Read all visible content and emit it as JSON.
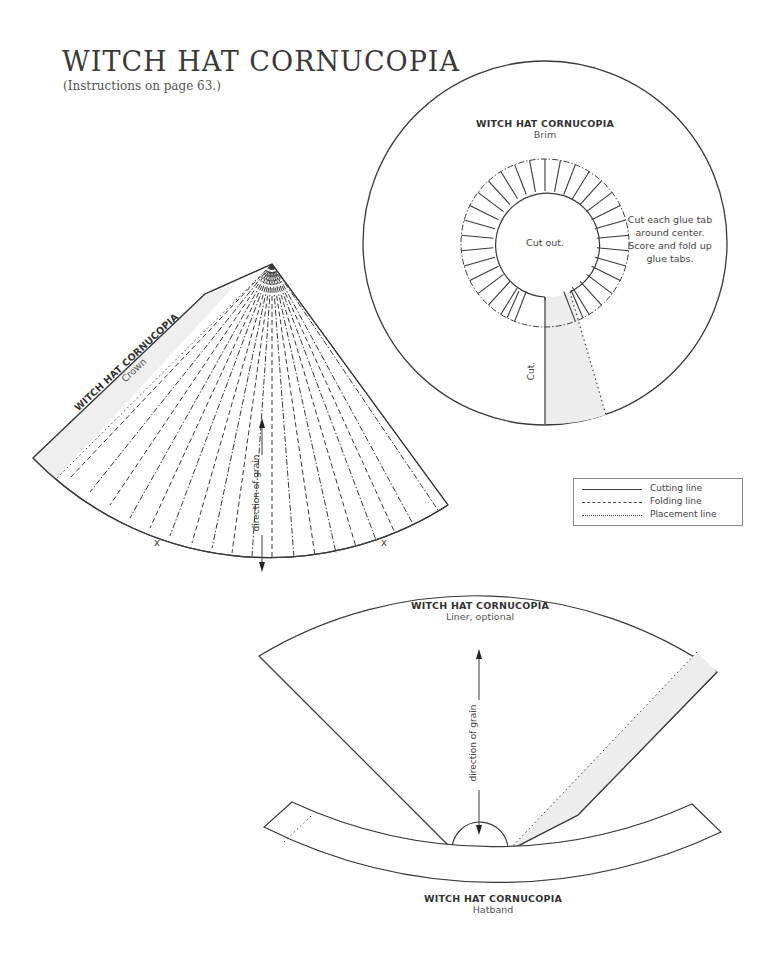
{
  "header": {
    "title": "WITCH HAT CORNUCOPIA",
    "subtitle": "(Instructions on page 63.)"
  },
  "pieces": {
    "brim": {
      "title": "WITCH HAT CORNUCOPIA",
      "name": "Brim",
      "center_label": "Cut out.",
      "cut_label": "Cut.",
      "note": [
        "Cut each glue tab",
        "around center.",
        "Score and fold up",
        "glue tabs."
      ]
    },
    "crown": {
      "title": "WITCH HAT CORNUCOPIA",
      "name": "Crown",
      "grain_label": "direction of grain",
      "marks": [
        "x",
        "x"
      ]
    },
    "liner": {
      "title": "WITCH HAT CORNUCOPIA",
      "name": "Liner, optional",
      "grain_label": "direction of grain"
    },
    "hatband": {
      "title": "WITCH HAT CORNUCOPIA",
      "name": "Hatband"
    }
  },
  "legend": {
    "items": [
      {
        "label": "Cutting line",
        "style": "solid"
      },
      {
        "label": "Folding line",
        "style": "dash-dot"
      },
      {
        "label": "Placement line",
        "style": "dotted"
      }
    ]
  },
  "colors": {
    "line": "#3a3a3a",
    "glue_area": "#ededed"
  }
}
